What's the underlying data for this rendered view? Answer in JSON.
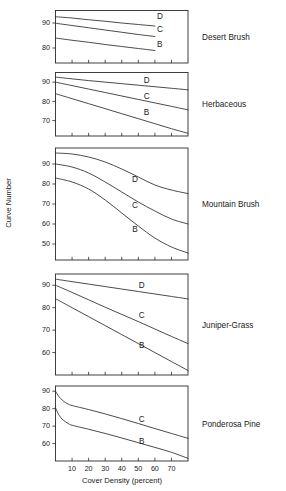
{
  "figure": {
    "title": "",
    "y_axis_title": "Curve Number",
    "x_axis_title": "Cover Density (percent)"
  },
  "chart_data": {
    "type": "line",
    "xlabel": "Cover Density (percent)",
    "ylabel": "Curve Number",
    "xlim": [
      0,
      80
    ],
    "xticks": [
      10,
      20,
      30,
      40,
      50,
      60,
      70
    ],
    "xtick_labels": [
      "10",
      "20",
      "30",
      "40",
      "50",
      "60",
      "70"
    ],
    "grid": false,
    "legend_position": "inline-end-of-line",
    "series_names": [
      "D",
      "C",
      "B"
    ],
    "panels": [
      {
        "name": "Desert Brush",
        "ylim": [
          74,
          95
        ],
        "yticks": [
          80,
          90
        ],
        "ytick_labels": [
          "80",
          "90"
        ],
        "x": [
          0,
          10,
          20,
          30,
          40,
          50,
          60
        ],
        "series": [
          {
            "name": "D",
            "values": [
              92.5,
              92.0,
              91.3,
              90.7,
              90.0,
              89.4,
              88.8
            ],
            "label_x": 63,
            "label_y": 91.5
          },
          {
            "name": "C",
            "values": [
              89.9,
              89.0,
              88.1,
              87.2,
              86.3,
              85.4,
              84.6
            ],
            "label_x": 63,
            "label_y": 86.3
          },
          {
            "name": "B",
            "values": [
              84.0,
              83.1,
              82.3,
              81.4,
              80.6,
              79.8,
              79.0
            ],
            "label_x": 63,
            "label_y": 80.4
          }
        ]
      },
      {
        "name": "Herbaceous",
        "ylim": [
          62,
          95
        ],
        "yticks": [
          70,
          80,
          90
        ],
        "ytick_labels": [
          "70",
          "80",
          "90"
        ],
        "x": [
          0,
          10,
          20,
          30,
          40,
          50,
          60,
          70,
          80
        ],
        "series": [
          {
            "name": "D",
            "values": [
              92.6,
              91.7,
              90.8,
              90.0,
              89.2,
              88.4,
              87.6,
              86.8,
              86.0
            ],
            "label_x": 55,
            "label_y": 89.5
          },
          {
            "name": "C",
            "values": [
              90.0,
              88.2,
              86.4,
              84.6,
              82.8,
              81.0,
              79.2,
              77.4,
              75.6
            ],
            "label_x": 55,
            "label_y": 81.0
          },
          {
            "name": "B",
            "values": [
              84.0,
              81.4,
              78.8,
              76.2,
              73.6,
              71.0,
              68.4,
              65.8,
              63.4
            ],
            "label_x": 55,
            "label_y": 73.0
          }
        ]
      },
      {
        "name": "Mountain Brush",
        "ylim": [
          42,
          98
        ],
        "yticks": [
          50,
          60,
          70,
          80,
          90
        ],
        "ytick_labels": [
          "50",
          "60",
          "70",
          "80",
          "90"
        ],
        "x": [
          0,
          10,
          20,
          30,
          40,
          50,
          60,
          70,
          80
        ],
        "series": [
          {
            "name": "D",
            "values": [
              95.5,
              95.0,
              93.5,
              91.0,
              87.5,
              83.5,
              79.5,
              77.0,
              75.2
            ],
            "label_x": 48,
            "label_y": 81.0
          },
          {
            "name": "C",
            "values": [
              90.0,
              88.5,
              85.5,
              81.0,
              76.0,
              71.0,
              66.5,
              62.5,
              60.0
            ],
            "label_x": 48,
            "label_y": 68.0
          },
          {
            "name": "B",
            "values": [
              83.0,
              81.0,
              77.5,
              72.0,
              65.5,
              59.0,
              53.0,
              48.5,
              45.5
            ],
            "label_x": 48,
            "label_y": 56.0
          }
        ]
      },
      {
        "name": "Juniper-Grass",
        "ylim": [
          50,
          95
        ],
        "yticks": [
          60,
          70,
          80,
          90
        ],
        "ytick_labels": [
          "60",
          "70",
          "80",
          "90"
        ],
        "x": [
          0,
          10,
          20,
          30,
          40,
          50,
          60,
          70,
          80
        ],
        "series": [
          {
            "name": "D",
            "values": [
              92.7,
              91.6,
              90.5,
              89.4,
              88.3,
              87.2,
              86.1,
              85.0,
              83.9
            ],
            "label_x": 52,
            "label_y": 88.8
          },
          {
            "name": "C",
            "values": [
              90.0,
              86.8,
              83.5,
              80.2,
              77.0,
              73.8,
              70.5,
              67.2,
              64.0
            ],
            "label_x": 52,
            "label_y": 75.5
          },
          {
            "name": "B",
            "values": [
              84.0,
              80.0,
              76.0,
              72.0,
              68.0,
              64.0,
              60.0,
              56.0,
              52.0
            ],
            "label_x": 52,
            "label_y": 62.0
          }
        ]
      },
      {
        "name": "Ponderosa Pine",
        "ylim": [
          50,
          93
        ],
        "yticks": [
          60,
          70,
          80,
          90
        ],
        "ytick_labels": [
          "60",
          "70",
          "80",
          "90"
        ],
        "x": [
          0,
          2,
          4,
          6,
          8,
          10,
          20,
          30,
          40,
          50,
          60,
          70,
          80
        ],
        "series": [
          {
            "name": "C",
            "values": [
              90.0,
              87.0,
              85.0,
              83.5,
              82.5,
              81.8,
              79.5,
              77.0,
              74.3,
              71.5,
              68.6,
              65.8,
              63.0
            ],
            "label_x": 52,
            "label_y": 72.5
          },
          {
            "name": "B",
            "values": [
              80.5,
              76.5,
              74.0,
              72.5,
              71.3,
              70.5,
              68.2,
              65.8,
              63.2,
              60.5,
              57.8,
              55.0,
              51.5
            ],
            "label_x": 52,
            "label_y": 60.0
          }
        ]
      }
    ]
  }
}
